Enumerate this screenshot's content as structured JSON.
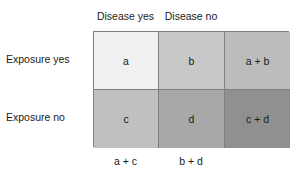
{
  "figure": {
    "border_color": "#808080",
    "text_color": "#1a1a1a",
    "background": "#ffffff"
  },
  "column_headers": [
    {
      "label": "Disease yes"
    },
    {
      "label": "Disease no"
    }
  ],
  "row_labels": [
    {
      "label": "Exposure yes"
    },
    {
      "label": "Exposure no"
    }
  ],
  "rows": [
    {
      "name": "exposure-yes",
      "cells": [
        {
          "label": "a",
          "color": "#f0f0f0"
        },
        {
          "label": "b",
          "color": "#c8c8c8"
        },
        {
          "label": "a + b",
          "color": "#bcbcbc"
        }
      ]
    },
    {
      "name": "exposure-no",
      "cells": [
        {
          "label": "c",
          "color": "#c0c0c0"
        },
        {
          "label": "d",
          "color": "#a8a8a8"
        },
        {
          "label": "c + d",
          "color": "#909090"
        }
      ]
    }
  ],
  "column_totals": [
    {
      "label": "a + c"
    },
    {
      "label": "b + d"
    }
  ]
}
